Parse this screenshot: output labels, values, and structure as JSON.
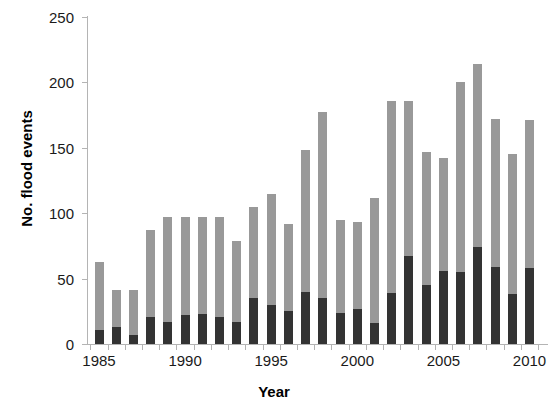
{
  "chart_data": {
    "type": "bar",
    "subtype": "stacked-bar",
    "title": "",
    "xlabel": "Year",
    "ylabel": "No. flood events",
    "ylim": [
      0,
      250
    ],
    "ytick_values": [
      0,
      50,
      100,
      150,
      200,
      250
    ],
    "ytick_labels": [
      "0",
      "50",
      "100",
      "150",
      "200",
      "250"
    ],
    "xlim": [
      1984.5,
      2010.5
    ],
    "xtick_labels": [
      "1985",
      "1990",
      "1995",
      "2000",
      "2005",
      "2010"
    ],
    "xtick_values": [
      1985,
      1990,
      1995,
      2000,
      2005,
      2010
    ],
    "grid": false,
    "legend": "none",
    "categories": [
      1985,
      1986,
      1987,
      1988,
      1989,
      1990,
      1991,
      1992,
      1993,
      1994,
      1995,
      1996,
      1997,
      1998,
      1999,
      2000,
      2001,
      2002,
      2003,
      2004,
      2005,
      2006,
      2007,
      2008,
      2009,
      2010
    ],
    "series": [
      {
        "name": "lower-segment",
        "color": "#333333",
        "values": [
          11,
          13,
          7,
          21,
          17,
          22,
          23,
          21,
          17,
          35,
          30,
          25,
          40,
          35,
          24,
          27,
          16,
          39,
          67,
          45,
          56,
          55,
          74,
          59,
          38,
          58
        ]
      },
      {
        "name": "upper-segment",
        "color": "#999999",
        "values": [
          52,
          28,
          34,
          66,
          80,
          75,
          74,
          76,
          62,
          70,
          85,
          67,
          108,
          142,
          71,
          66,
          96,
          147,
          119,
          102,
          86,
          145,
          140,
          113,
          107,
          113
        ]
      }
    ],
    "totals": [
      63,
      41,
      41,
      87,
      97,
      97,
      97,
      97,
      79,
      105,
      115,
      92,
      148,
      177,
      95,
      93,
      112,
      186,
      186,
      147,
      142,
      200,
      214,
      172,
      145,
      171
    ]
  },
  "axes": {
    "y_title": "No. flood events",
    "x_title": "Year"
  },
  "colors": {
    "bar_upper": "#999999",
    "bar_lower": "#333333",
    "axis": "#b4b4b4",
    "text": "#1a1a1a",
    "background": "#ffffff"
  }
}
